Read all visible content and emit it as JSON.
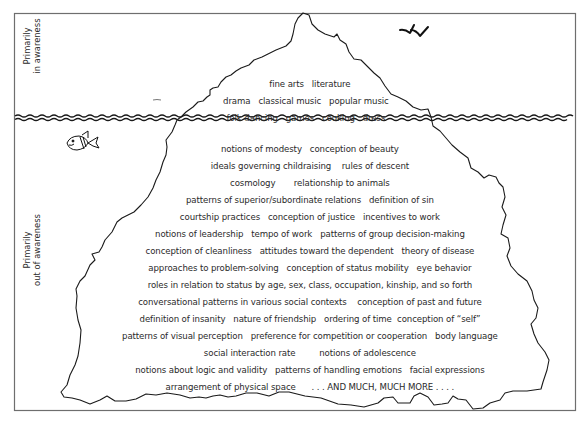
{
  "labels": {
    "above_line1": "Primarily",
    "above_line2": "in awareness",
    "below_line1": "Primarily",
    "below_line2": "out of awareness"
  },
  "above_water": {
    "rows": [
      [
        "fine arts",
        "literature"
      ],
      [
        "drama",
        "classical music",
        "popular music"
      ],
      [
        "folk dancing",
        "games",
        "cooking",
        "dress"
      ]
    ]
  },
  "below_water": {
    "rows": [
      [
        "notions of modesty",
        "conception of beauty"
      ],
      [
        "ideals governing childraising",
        "rules of descent"
      ],
      [
        "cosmology",
        "relationship to animals"
      ],
      [
        "patterns of superior/subordinate relations",
        "definition of sin"
      ],
      [
        "courtship practices",
        "conception of justice",
        "incentives to work"
      ],
      [
        "notions of leadership",
        "tempo of work",
        "patterns of group decision-making"
      ],
      [
        "conception of cleanliness",
        "attitudes toward the dependent",
        "theory of disease"
      ],
      [
        "approaches to problem-solving",
        "conception of status mobility",
        "eye behavior"
      ],
      [
        "roles in relation to status by age, sex, class, occupation, kinship, and so forth"
      ],
      [
        "conversational patterns in various social contexts",
        "conception of past and future"
      ],
      [
        "definition of insanity",
        "nature of friendship",
        "ordering of time",
        "conception of “self”"
      ],
      [
        "patterns of visual perception",
        "preference for competition or cooperation",
        "body language"
      ],
      [
        "social interaction rate",
        "notions of adolescence"
      ],
      [
        "notions about logic and validity",
        "patterns of handling emotions",
        "facial expressions"
      ],
      [
        "arrangement of physical space",
        ". . . AND MUCH, MUCH MORE . . . ."
      ]
    ]
  },
  "decorations": {
    "icons": [
      "birds-icon",
      "fish-icon",
      "iceberg-outline",
      "waterline-waves"
    ]
  },
  "colors": {
    "ink": "#1a1a1a",
    "frame": "#6e6e6e",
    "text": "#2a2a2a",
    "background": "#ffffff"
  }
}
